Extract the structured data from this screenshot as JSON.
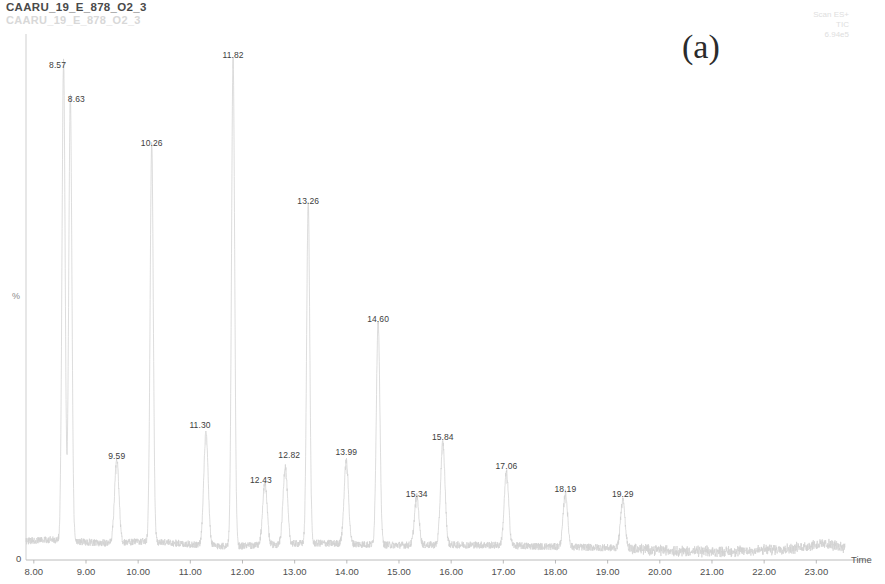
{
  "header": {
    "title": "CAARU_19_E_878_O2_3",
    "title_ghost": "CAARU_19_E_878_O2_3",
    "panel_label": "(a)"
  },
  "meta": {
    "line1": "Scan ES+",
    "line2": "TIC",
    "line3": "6.94e5"
  },
  "axes": {
    "y_label": "%",
    "y_origin": "0",
    "x_title": "Time"
  },
  "chart_data": {
    "type": "line",
    "title": "CAARU_19_E_878_O2_3",
    "subtitle": "Scan ES+ TIC 6.94e5",
    "xlabel": "Time",
    "ylabel": "%",
    "xlim": [
      7.85,
      23.55
    ],
    "ylim": [
      0,
      100
    ],
    "grid": false,
    "legend": null,
    "x_ticks": [
      "8.00",
      "9.00",
      "10.00",
      "11.00",
      "12.00",
      "13.00",
      "14.00",
      "15.00",
      "16.00",
      "17.00",
      "18.00",
      "19.00",
      "20.00",
      "21.00",
      "22.00",
      "23.00"
    ],
    "x_tick_values": [
      8,
      9,
      10,
      11,
      12,
      13,
      14,
      15,
      16,
      17,
      18,
      19,
      20,
      21,
      22,
      23
    ],
    "peaks": [
      {
        "label": "8.57",
        "rt": 8.57,
        "height": 98
      },
      {
        "label": "8.63",
        "rt": 8.7,
        "height": 91
      },
      {
        "label": "9.59",
        "rt": 9.59,
        "height": 17
      },
      {
        "label": "10.26",
        "rt": 10.26,
        "height": 82
      },
      {
        "label": "11.30",
        "rt": 11.3,
        "height": 23
      },
      {
        "label": "11.82",
        "rt": 11.82,
        "height": 100
      },
      {
        "label": "12.43",
        "rt": 12.43,
        "height": 13
      },
      {
        "label": "12.82",
        "rt": 12.82,
        "height": 16
      },
      {
        "label": "13.26",
        "rt": 13.26,
        "height": 70
      },
      {
        "label": "13.99",
        "rt": 13.99,
        "height": 17
      },
      {
        "label": "14.60",
        "rt": 14.6,
        "height": 46
      },
      {
        "label": "15.34",
        "rt": 15.34,
        "height": 10
      },
      {
        "label": "15.84",
        "rt": 15.84,
        "height": 21
      },
      {
        "label": "17.06",
        "rt": 17.06,
        "height": 15
      },
      {
        "label": "18.19",
        "rt": 18.19,
        "height": 11
      },
      {
        "label": "19.29",
        "rt": 19.29,
        "height": 10
      }
    ]
  }
}
